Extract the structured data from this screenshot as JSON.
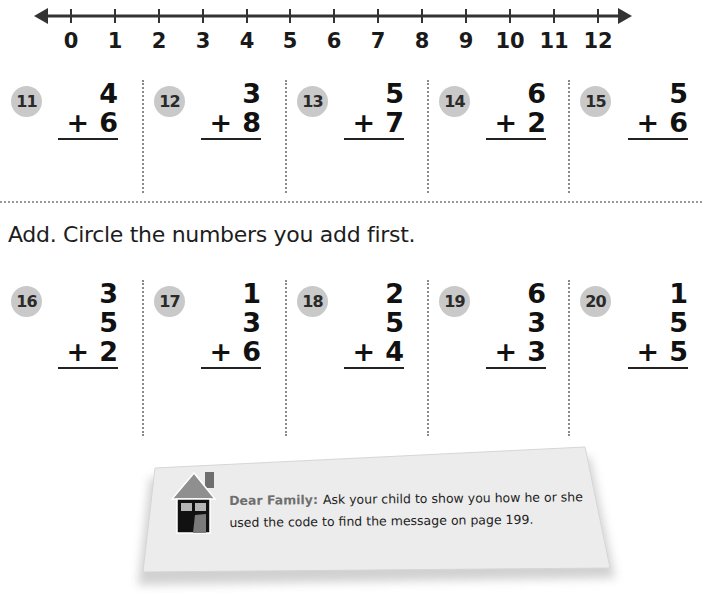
{
  "number_line": {
    "min": 0,
    "max": 12,
    "labels": [
      "0",
      "1",
      "2",
      "3",
      "4",
      "5",
      "6",
      "7",
      "8",
      "9",
      "10",
      "11",
      "12"
    ]
  },
  "section1": {
    "problems": [
      {
        "number": "11",
        "addends": [
          "4",
          "6"
        ]
      },
      {
        "number": "12",
        "addends": [
          "3",
          "8"
        ]
      },
      {
        "number": "13",
        "addends": [
          "5",
          "7"
        ]
      },
      {
        "number": "14",
        "addends": [
          "6",
          "2"
        ]
      },
      {
        "number": "15",
        "addends": [
          "5",
          "6"
        ]
      }
    ]
  },
  "section2": {
    "instruction": "Add. Circle the numbers you add first.",
    "problems": [
      {
        "number": "16",
        "addends": [
          "3",
          "5",
          "2"
        ]
      },
      {
        "number": "17",
        "addends": [
          "1",
          "3",
          "6"
        ]
      },
      {
        "number": "18",
        "addends": [
          "2",
          "5",
          "4"
        ]
      },
      {
        "number": "19",
        "addends": [
          "6",
          "3",
          "3"
        ]
      },
      {
        "number": "20",
        "addends": [
          "1",
          "5",
          "5"
        ]
      }
    ]
  },
  "operator": "+",
  "family_note": {
    "icon": "house-icon",
    "lead": "Dear Family:",
    "body": "Ask your child to show you how he or she used the code to find the message on page 199."
  },
  "colors": {
    "badge": "#c9c9c9",
    "card": "#ececec",
    "house_roof": "#8f8f8f",
    "house_body": "#111111"
  }
}
